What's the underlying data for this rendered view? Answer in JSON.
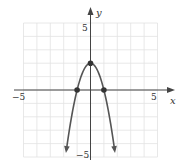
{
  "chart_data": {
    "type": "line",
    "title": "",
    "xlabel": "x",
    "ylabel": "y",
    "xlim": [
      -5,
      5
    ],
    "ylim": [
      -5,
      5
    ],
    "grid": true,
    "grid_step": 1,
    "x_tick_labels": [
      "-5",
      "5"
    ],
    "y_tick_labels": [
      "5",
      "-5"
    ],
    "function": "y = 2 - 2x^2",
    "series": [
      {
        "name": "parabola",
        "x": [
          -1.8,
          -1.5,
          -1,
          -0.5,
          0,
          0.5,
          1,
          1.5,
          1.8
        ],
        "y": [
          -4.48,
          -2.5,
          0,
          1.5,
          2,
          1.5,
          0,
          -2.5,
          -4.48
        ],
        "arrows_at_ends": true
      }
    ],
    "marked_points": [
      {
        "x": -1,
        "y": 0
      },
      {
        "x": 0,
        "y": 2
      },
      {
        "x": 1,
        "y": 0
      }
    ],
    "legend": null
  },
  "labels": {
    "x_axis": "x",
    "y_axis": "y",
    "x_min": "−5",
    "x_max": "5",
    "y_max": "5",
    "y_min": "−5"
  },
  "colors": {
    "grid": "#e2e2e2",
    "axis": "#444444",
    "curve": "#555555",
    "point": "#333333"
  }
}
